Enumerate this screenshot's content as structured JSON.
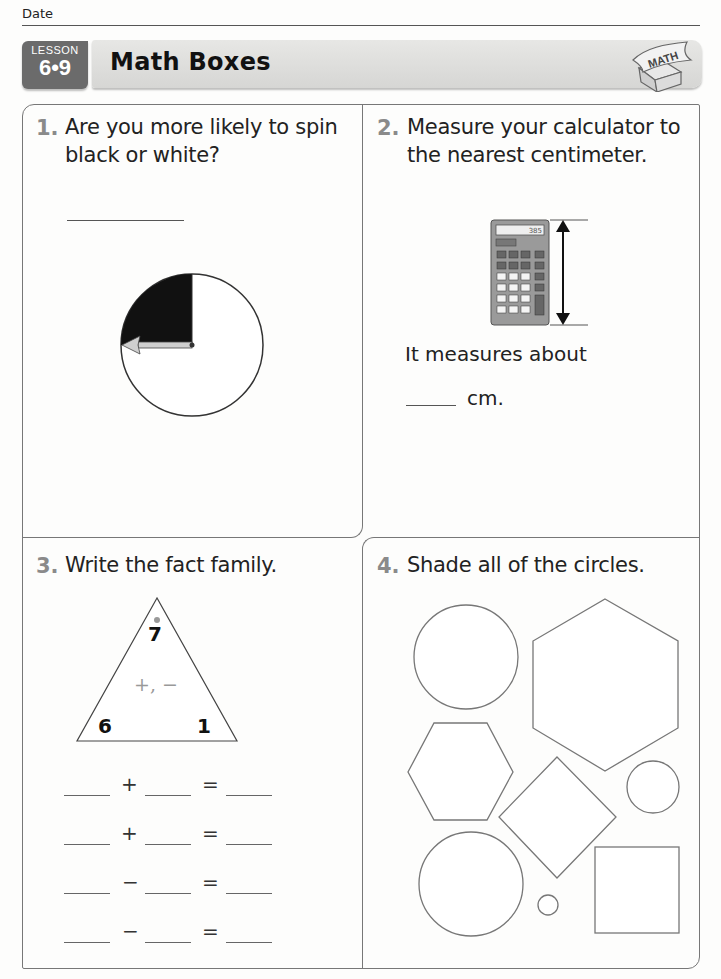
{
  "header": {
    "date_label": "Date",
    "lesson_label": "LESSON",
    "lesson_number": "6•9",
    "title": "Math Boxes",
    "logo_text": "MATH"
  },
  "problems": [
    {
      "number": "1.",
      "text_line1": "Are you more likely to spin",
      "text_line2": "black or white?",
      "spinner": {
        "black_fraction": 0.25,
        "white_fraction": 0.75,
        "arrow_direction": "left",
        "colors": {
          "black": "#111111",
          "white": "#ffffff"
        }
      }
    },
    {
      "number": "2.",
      "text_line1": "Measure your calculator to",
      "text_line2": "the nearest centimeter.",
      "calculator_display": "385",
      "answer_prefix": "It measures about",
      "answer_unit": "cm."
    },
    {
      "number": "3.",
      "text": "Write the fact family.",
      "triangle": {
        "top": "7",
        "left": "6",
        "right": "1",
        "operations": "+, −"
      },
      "equations": [
        {
          "op": "+",
          "eq": "="
        },
        {
          "op": "+",
          "eq": "="
        },
        {
          "op": "−",
          "eq": "="
        },
        {
          "op": "−",
          "eq": "="
        }
      ]
    },
    {
      "number": "4.",
      "text": "Shade all of the circles.",
      "shapes": [
        "circle-large",
        "hexagon-large",
        "hexagon-small",
        "diamond",
        "circle-medium",
        "circle-large-bottom",
        "circle-tiny",
        "square"
      ]
    }
  ]
}
